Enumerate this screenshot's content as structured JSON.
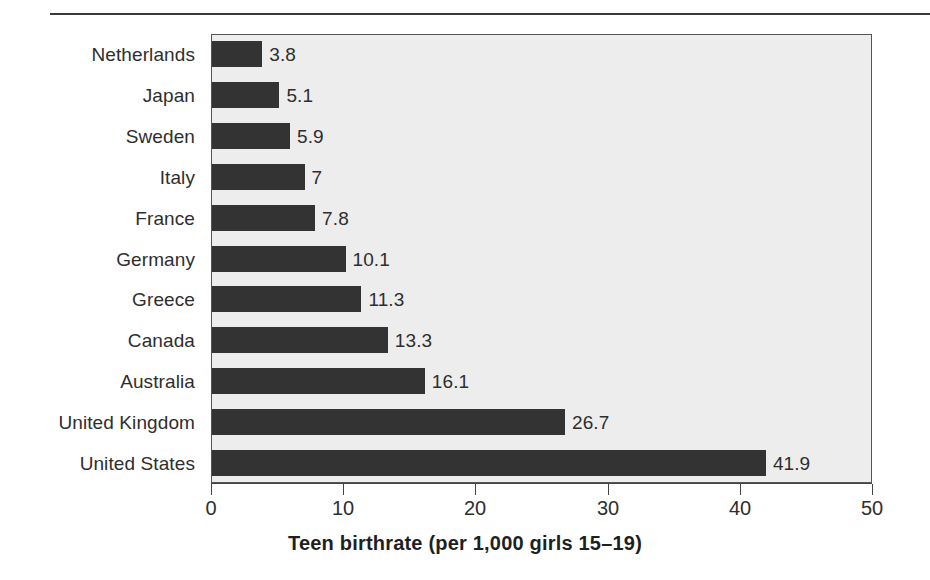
{
  "figure": {
    "top_rule": "horizontal-rule",
    "background_color": "#ffffff",
    "plot_background_color": "#ededed",
    "bar_color": "#333333",
    "axis_color": "#444444"
  },
  "chart_data": {
    "type": "bar",
    "orientation": "horizontal",
    "title": "",
    "subtitle": "",
    "xlabel": "Teen birthrate (per 1,000 girls 15–19)",
    "ylabel": "",
    "xlim": [
      0,
      50
    ],
    "xticks": [
      0,
      10,
      20,
      30,
      40,
      50
    ],
    "xtick_labels": [
      "0",
      "10",
      "20",
      "30",
      "40",
      "50"
    ],
    "grid": false,
    "legend": null,
    "categories": [
      "Netherlands",
      "Japan",
      "Sweden",
      "Italy",
      "France",
      "Germany",
      "Greece",
      "Canada",
      "Australia",
      "United Kingdom",
      "United States"
    ],
    "values": [
      3.8,
      5.1,
      5.9,
      7,
      7.8,
      10.1,
      11.3,
      13.3,
      16.1,
      26.7,
      41.9
    ],
    "value_labels": [
      "3.8",
      "5.1",
      "5.9",
      "7",
      "7.8",
      "10.1",
      "11.3",
      "13.3",
      "16.1",
      "26.7",
      "41.9"
    ]
  }
}
